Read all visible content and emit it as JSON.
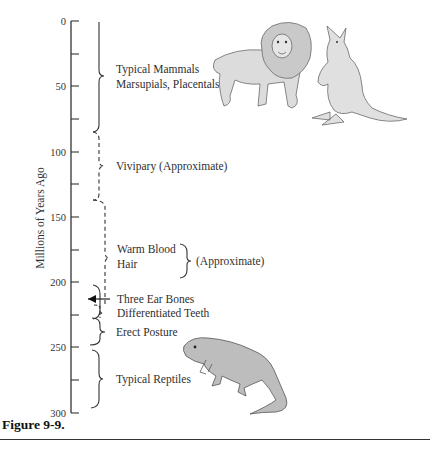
{
  "axis": {
    "title": "Millions of  Years Ago",
    "ticks": [
      {
        "value": 0,
        "label": "0",
        "y": 21
      },
      {
        "value": 25,
        "label": "",
        "y": 54
      },
      {
        "value": 50,
        "label": "50",
        "y": 86
      },
      {
        "value": 75,
        "label": "",
        "y": 119
      },
      {
        "value": 100,
        "label": "100",
        "y": 152
      },
      {
        "value": 125,
        "label": "",
        "y": 184
      },
      {
        "value": 150,
        "label": "150",
        "y": 217
      },
      {
        "value": 175,
        "label": "",
        "y": 250
      },
      {
        "value": 200,
        "label": "200",
        "y": 282
      },
      {
        "value": 225,
        "label": "",
        "y": 315
      },
      {
        "value": 250,
        "label": "250",
        "y": 347
      },
      {
        "value": 275,
        "label": "",
        "y": 380
      },
      {
        "value": 300,
        "label": "300",
        "y": 413
      }
    ]
  },
  "stages": [
    {
      "id": "typical-mammals",
      "lines": [
        "Typical Mammals",
        "Marsupials, Placentals"
      ],
      "from_mya": 0,
      "to_mya": 85,
      "style": "solid"
    },
    {
      "id": "vivipary",
      "lines": [
        "Vivipary (Approximate)"
      ],
      "from_mya": 85,
      "to_mya": 138,
      "style": "dashed"
    },
    {
      "id": "warm-blood-hair",
      "lines": [
        "Warm Blood",
        "Hair"
      ],
      "side_note": "(Approximate)",
      "from_mya": 138,
      "to_mya": 220,
      "style": "dashed"
    },
    {
      "id": "three-ear-bones",
      "lines": [
        "Three Ear Bones"
      ],
      "marker": "arrow",
      "at_mya": 217
    },
    {
      "id": "differentiated-teeth",
      "lines": [
        "Differentiated Teeth"
      ],
      "from_mya": 220,
      "to_mya": 230,
      "style": "dashed"
    },
    {
      "id": "erect-posture",
      "lines": [
        "Erect Posture"
      ],
      "from_mya": 230,
      "to_mya": 248,
      "style": "solid"
    },
    {
      "id": "typical-reptiles",
      "lines": [
        "Typical Reptiles"
      ],
      "from_mya": 252,
      "to_mya": 300,
      "style": "solid"
    }
  ],
  "illustrations": [
    {
      "name": "lion",
      "label": "lion-illustration"
    },
    {
      "name": "kangaroo",
      "label": "kangaroo-illustration"
    },
    {
      "name": "lizard",
      "label": "lizard-illustration"
    }
  ],
  "chart_data": {
    "type": "table",
    "title": "Figure 9-9.",
    "ylabel": "Millions of Years Ago",
    "ylim": [
      0,
      300
    ],
    "yticks": [
      0,
      50,
      100,
      150,
      200,
      250,
      300
    ],
    "rows": [
      {
        "feature": "Typical Mammals / Marsupials, Placentals",
        "start_mya": 85,
        "end_mya": 0
      },
      {
        "feature": "Vivipary (Approximate)",
        "start_mya": 138,
        "end_mya": 85
      },
      {
        "feature": "Warm Blood, Hair (Approximate)",
        "start_mya": 220,
        "end_mya": 138
      },
      {
        "feature": "Three Ear Bones",
        "at_mya": 217
      },
      {
        "feature": "Differentiated Teeth",
        "start_mya": 230,
        "end_mya": 220
      },
      {
        "feature": "Erect Posture",
        "start_mya": 248,
        "end_mya": 230
      },
      {
        "feature": "Typical Reptiles",
        "start_mya": 300,
        "end_mya": 252
      }
    ]
  },
  "caption": "Figure 9-9."
}
